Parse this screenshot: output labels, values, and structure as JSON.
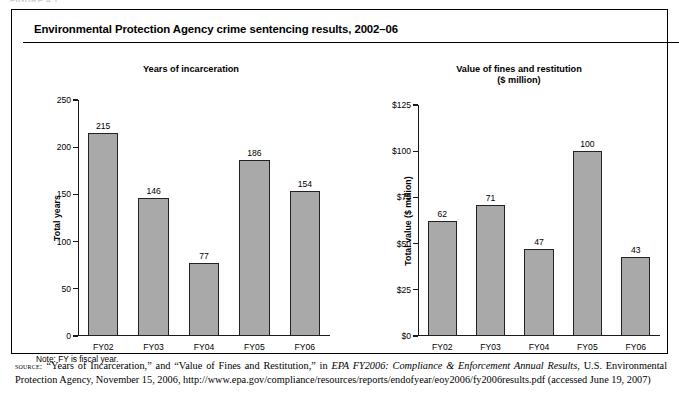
{
  "running_header": "FIGURE 4.1",
  "figure": {
    "title": "Environmental Protection Agency crime sentencing results, 2002–06",
    "note": "Note:  FY is fiscal year."
  },
  "source": {
    "label": "source:",
    "text": " “Years of Incarceration,” and “Value of Fines and Restitution,” in ",
    "italic_title": "EPA FY2006: Compliance & Enforcement Annual Results",
    "tail": ", U.S. Environmental Protection Agency, November 15, 2006, http://www.epa.gov/compliance/resources/reports/endofyear/eoy2006/fy2006results.pdf (accessed June 19, 2007)"
  },
  "chart_data": [
    {
      "type": "bar",
      "panel": "left",
      "title": "Years of incarceration",
      "categories": [
        "FY02",
        "FY03",
        "FY04",
        "FY05",
        "FY06"
      ],
      "values": [
        215,
        146,
        77,
        186,
        154
      ],
      "value_labels": [
        "215",
        "146",
        "77",
        "186",
        "154"
      ],
      "xlabel": "",
      "ylabel": "Total years",
      "ylim": [
        0,
        250
      ],
      "yticks": [
        0,
        50,
        100,
        150,
        200,
        250
      ],
      "ytick_labels": [
        "0",
        "50",
        "100",
        "150",
        "200",
        "250"
      ],
      "grid": false,
      "legend": "none",
      "bar_color": "#a9a9a9",
      "bar_edge_color": "#222222"
    },
    {
      "type": "bar",
      "panel": "right",
      "title": "Value of fines and restitution\n($ million)",
      "categories": [
        "FY02",
        "FY03",
        "FY04",
        "FY05",
        "FY06"
      ],
      "values": [
        62,
        71,
        47,
        100,
        43
      ],
      "value_labels": [
        "62",
        "71",
        "47",
        "100",
        "43"
      ],
      "xlabel": "",
      "ylabel": "Total value ($ million)",
      "ylim": [
        0,
        125
      ],
      "yticks": [
        0,
        25,
        50,
        75,
        100,
        125
      ],
      "ytick_labels": [
        "$0",
        "$25",
        "$50",
        "$75",
        "$100",
        "$125"
      ],
      "grid": false,
      "legend": "none",
      "bar_color": "#a9a9a9",
      "bar_edge_color": "#222222"
    }
  ]
}
